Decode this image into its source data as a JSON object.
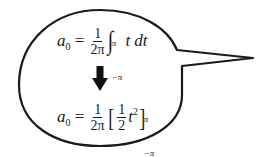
{
  "bubble": {
    "shape": "speech-bubble",
    "tail_direction": "right",
    "stroke_color": "#1a1a1a",
    "fill_color": "#ffffff"
  },
  "equation_1": {
    "lhs_var": "a",
    "lhs_sub": "0",
    "equals": "=",
    "frac_num": "1",
    "frac_den": "2π",
    "integral": "∫",
    "upper_limit": "π",
    "lower_limit": "−π",
    "integrand": "t dt"
  },
  "arrow": {
    "icon": "down-arrow-icon",
    "glyph": "⬇"
  },
  "equation_2": {
    "lhs_var": "a",
    "lhs_sub": "0",
    "equals": "=",
    "frac_num": "1",
    "frac_den": "2π",
    "open_bracket": "[",
    "inner_frac_num": "1",
    "inner_frac_den": "2",
    "term_var": "t",
    "term_exp": "2",
    "close_bracket": "]",
    "upper_limit": "π",
    "lower_limit": "−π"
  }
}
